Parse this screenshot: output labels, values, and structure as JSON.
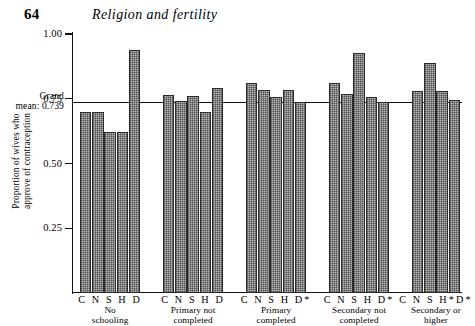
{
  "page": {
    "folio": "64",
    "running_title": "Religion and fertility"
  },
  "chart_data": {
    "type": "bar",
    "title": "",
    "xlabel": "",
    "ylabel": "Proportion of wives who approve of contraception",
    "ylabel_line1": "Proportion of wives who",
    "ylabel_line2": "approve of contraception",
    "ylim": [
      0,
      1.0
    ],
    "ytick_labels": [
      "1.00",
      "0.75",
      "0.50",
      "0.25"
    ],
    "ytick_values": [
      1.0,
      0.75,
      0.5,
      0.25
    ],
    "grid": false,
    "legend": "none",
    "reference_line": {
      "label_line1": "Grand",
      "label_line2": "mean: 0.739",
      "value": 0.739
    },
    "groups": [
      {
        "caption_line1": "No",
        "caption_line2": "schooling",
        "codes": "C N S H D",
        "categories": [
          "C",
          "N",
          "S",
          "H",
          "D"
        ],
        "values": [
          0.7,
          0.7,
          0.62,
          0.62,
          0.94
        ]
      },
      {
        "caption_line1": "Primary not",
        "caption_line2": "completed",
        "codes": "C N S H D",
        "categories": [
          "C",
          "N",
          "S",
          "H",
          "D"
        ],
        "values": [
          0.765,
          0.74,
          0.76,
          0.7,
          0.79
        ]
      },
      {
        "caption_line1": "Primary",
        "caption_line2": "completed",
        "codes": "C N S H D*",
        "categories": [
          "C",
          "N",
          "S",
          "H",
          "D*"
        ],
        "values": [
          0.81,
          0.785,
          0.755,
          0.785,
          0.739
        ]
      },
      {
        "caption_line1": "Secondary not",
        "caption_line2": "completed",
        "codes": "C N S H D*",
        "categories": [
          "C",
          "N",
          "S",
          "H",
          "D*"
        ],
        "values": [
          0.81,
          0.77,
          0.925,
          0.755,
          0.739
        ]
      },
      {
        "caption_line1": "Secondary or",
        "caption_line2": "higher",
        "codes": "C N S H*D*",
        "categories": [
          "C",
          "N",
          "S",
          "H*D*"
        ],
        "values": [
          0.78,
          0.89,
          0.78,
          0.745
        ]
      }
    ]
  }
}
